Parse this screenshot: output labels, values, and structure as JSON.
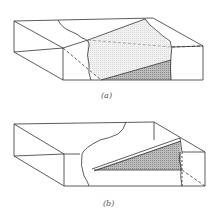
{
  "figure": {
    "panels": [
      {
        "id": "a",
        "label": "(a)",
        "description": "Block with inclined plane cutting through; upper region lightly stippled, lower triangular region darkly hatched"
      },
      {
        "id": "b",
        "label": "(b)",
        "description": "Block with thin inclined wedge-shaped sheet; triangular region darkly hatched"
      }
    ],
    "colors": {
      "line": "#333333",
      "light_fill": "#ececec",
      "dark_fill": "#a9a9a9",
      "background": "#ffffff"
    }
  }
}
